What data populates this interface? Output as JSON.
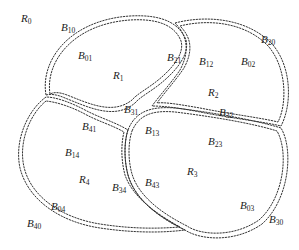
{
  "figure": {
    "stroke_color": "#333333"
  },
  "regions": [
    {
      "id": "R0",
      "main": "R",
      "sub": "0",
      "x": 21,
      "y": 13
    },
    {
      "id": "R1",
      "main": "R",
      "sub": "1",
      "x": 113,
      "y": 70
    },
    {
      "id": "R2",
      "main": "R",
      "sub": "2",
      "x": 208,
      "y": 87
    },
    {
      "id": "R3",
      "main": "R",
      "sub": "3",
      "x": 187,
      "y": 166
    },
    {
      "id": "R4",
      "main": "R",
      "sub": "4",
      "x": 79,
      "y": 174
    }
  ],
  "boundaries": [
    {
      "id": "B10",
      "main": "B",
      "sub": "10",
      "x": 61,
      "y": 22
    },
    {
      "id": "B01",
      "main": "B",
      "sub": "01",
      "x": 78,
      "y": 50
    },
    {
      "id": "B31",
      "main": "B",
      "sub": "31",
      "x": 124,
      "y": 104
    },
    {
      "id": "B41",
      "main": "B",
      "sub": "41",
      "x": 82,
      "y": 121
    },
    {
      "id": "B21",
      "main": "B",
      "sub": "21",
      "x": 167,
      "y": 52
    },
    {
      "id": "B12",
      "main": "B",
      "sub": "12",
      "x": 199,
      "y": 56
    },
    {
      "id": "B02",
      "main": "B",
      "sub": "02",
      "x": 241,
      "y": 56
    },
    {
      "id": "B20",
      "main": "B",
      "sub": "20",
      "x": 261,
      "y": 34
    },
    {
      "id": "B32",
      "main": "B",
      "sub": "32",
      "x": 219,
      "y": 107
    },
    {
      "id": "B13",
      "main": "B",
      "sub": "13",
      "x": 145,
      "y": 125
    },
    {
      "id": "B23",
      "main": "B",
      "sub": "23",
      "x": 208,
      "y": 136
    },
    {
      "id": "B14",
      "main": "B",
      "sub": "14",
      "x": 65,
      "y": 147
    },
    {
      "id": "B34",
      "main": "B",
      "sub": "34",
      "x": 112,
      "y": 182
    },
    {
      "id": "B43",
      "main": "B",
      "sub": "43",
      "x": 145,
      "y": 177
    },
    {
      "id": "B04",
      "main": "B",
      "sub": "04",
      "x": 51,
      "y": 201
    },
    {
      "id": "B40",
      "main": "B",
      "sub": "40",
      "x": 27,
      "y": 218
    },
    {
      "id": "B03",
      "main": "B",
      "sub": "03",
      "x": 240,
      "y": 200
    },
    {
      "id": "B30",
      "main": "B",
      "sub": "30",
      "x": 269,
      "y": 214
    }
  ]
}
